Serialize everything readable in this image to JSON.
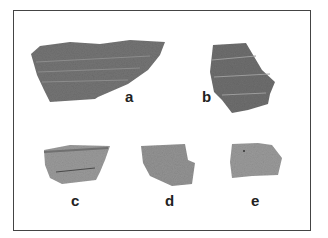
{
  "figure": {
    "labels": {
      "a": "a",
      "b": "b",
      "c": "c",
      "d": "d",
      "e": "e"
    },
    "colors": {
      "border": "#444444",
      "sherd_dark": "#6e6e6e",
      "sherd_light": "#9a9a9a"
    }
  }
}
